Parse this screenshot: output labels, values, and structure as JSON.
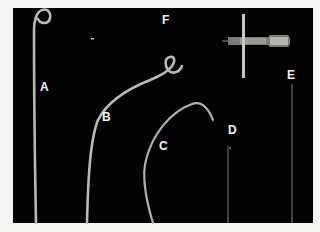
{
  "figure": {
    "background_color": "#020202",
    "page_color": "#f4f4f2",
    "device_color": "#b8b8b4",
    "labels": [
      {
        "id": "A",
        "text": "A",
        "x": 40,
        "y": 81
      },
      {
        "id": "B",
        "text": "B",
        "x": 102,
        "y": 111
      },
      {
        "id": "C",
        "text": "C",
        "x": 159,
        "y": 140
      },
      {
        "id": "D",
        "text": "D",
        "x": 228,
        "y": 124
      },
      {
        "id": "E",
        "text": "E",
        "x": 287,
        "y": 69
      },
      {
        "id": "F",
        "text": "F",
        "x": 162,
        "y": 14
      }
    ],
    "items": [
      {
        "label": "A",
        "description": "pigtail catheter"
      },
      {
        "label": "B",
        "description": "curved catheter with pigtail tip"
      },
      {
        "label": "C",
        "description": "curved catheter"
      },
      {
        "label": "D",
        "description": "straight guidewire"
      },
      {
        "label": "E",
        "description": "straight guidewire"
      },
      {
        "label": "F",
        "description": "needle with hub and cross-bar"
      }
    ]
  }
}
